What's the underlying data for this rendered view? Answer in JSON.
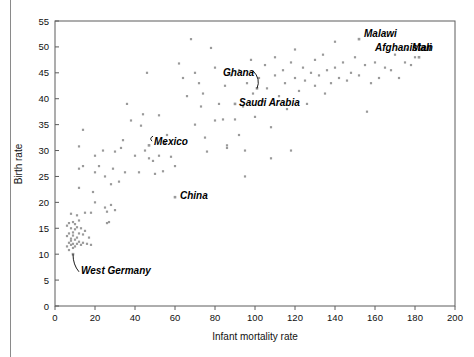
{
  "figure": {
    "background": "#ffffff",
    "frame_color": "#5c5c5c",
    "point_color": "#9a9a9a",
    "label_color": "#000000"
  },
  "chart_data": {
    "type": "scatter",
    "title": "",
    "xlabel": "Infant mortality rate",
    "ylabel": "Birth rate",
    "xlim": [
      0,
      200
    ],
    "ylim": [
      0,
      55
    ],
    "xticks": [
      0,
      20,
      40,
      60,
      80,
      100,
      120,
      140,
      160,
      180,
      200
    ],
    "yticks": [
      0,
      5,
      10,
      15,
      20,
      25,
      30,
      35,
      40,
      45,
      50,
      55
    ],
    "grid": false,
    "legend": null,
    "marker": "square-dot",
    "annotations": [
      {
        "label": "Malawi",
        "x": 152,
        "y": 51.5,
        "text_dx": 5,
        "text_dy": 1.0,
        "anchor": "start",
        "leader": "none"
      },
      {
        "label": "Mali",
        "x": 176,
        "y": 49.5,
        "text_dx": 5,
        "text_dy": 0.3,
        "anchor": "start",
        "leader": "none"
      },
      {
        "label": "Afghanistan",
        "x": 182,
        "y": 48.0,
        "text_dx": -44,
        "text_dy": 1.8,
        "anchor": "start",
        "leader": "none"
      },
      {
        "label": "Ghana",
        "x": 101,
        "y": 42.0,
        "text_dx": -34,
        "text_dy": 3.0,
        "anchor": "start",
        "leader": "curve-down-right"
      },
      {
        "label": "Saudi Arabia",
        "x": 90,
        "y": 39.0,
        "text_dx": 4,
        "text_dy": 0.2,
        "anchor": "start",
        "leader": "none"
      },
      {
        "label": "Mexico",
        "x": 47,
        "y": 31.0,
        "text_dx": 5,
        "text_dy": 0.8,
        "anchor": "start",
        "leader": "hook-left"
      },
      {
        "label": "China",
        "x": 60,
        "y": 21.0,
        "text_dx": 5,
        "text_dy": 0.3,
        "anchor": "start",
        "leader": "none"
      },
      {
        "label": "West Germany",
        "x": 9,
        "y": 10.0,
        "text_dx": 8,
        "text_dy": -3.2,
        "anchor": "start",
        "leader": "curve-up-left"
      }
    ],
    "points": [
      [
        6,
        13.5
      ],
      [
        6,
        15.5
      ],
      [
        6,
        11.5
      ],
      [
        7,
        16.0
      ],
      [
        7,
        14.0
      ],
      [
        7,
        12.2
      ],
      [
        7,
        10.8
      ],
      [
        8,
        17.8
      ],
      [
        8,
        15.0
      ],
      [
        8,
        13.0
      ],
      [
        8,
        11.8
      ],
      [
        8,
        12.6
      ],
      [
        9,
        16.2
      ],
      [
        9,
        14.2
      ],
      [
        9,
        12.0
      ],
      [
        9,
        11.2
      ],
      [
        9,
        13.6
      ],
      [
        10,
        15.8
      ],
      [
        10,
        14.8
      ],
      [
        10,
        12.8
      ],
      [
        10,
        11.5
      ],
      [
        11,
        17.5
      ],
      [
        11,
        15.2
      ],
      [
        11,
        13.2
      ],
      [
        11,
        12.0
      ],
      [
        12,
        22.8
      ],
      [
        12,
        16.5
      ],
      [
        12,
        14.0
      ],
      [
        12,
        12.4
      ],
      [
        13,
        15.0
      ],
      [
        13,
        11.8
      ],
      [
        14,
        13.8
      ],
      [
        14,
        12.2
      ],
      [
        15,
        18.0
      ],
      [
        15,
        14.5
      ],
      [
        16,
        12.0
      ],
      [
        17,
        13.2
      ],
      [
        18,
        18.0
      ],
      [
        18,
        11.8
      ],
      [
        12,
        26.5
      ],
      [
        14,
        27.0
      ],
      [
        12,
        30.8
      ],
      [
        14,
        34.0
      ],
      [
        19,
        22.0
      ],
      [
        20,
        20.0
      ],
      [
        20,
        25.8
      ],
      [
        20,
        29.0
      ],
      [
        22,
        27.0
      ],
      [
        24,
        30.0
      ],
      [
        25,
        25.0
      ],
      [
        25,
        19.0
      ],
      [
        26,
        16.0
      ],
      [
        26,
        18.2
      ],
      [
        27,
        16.2
      ],
      [
        28,
        19.5
      ],
      [
        28,
        23.5
      ],
      [
        29,
        26.5
      ],
      [
        30,
        29.8
      ],
      [
        30,
        18.5
      ],
      [
        32,
        24.0
      ],
      [
        33,
        30.5
      ],
      [
        34,
        32.0
      ],
      [
        35,
        25.8
      ],
      [
        36,
        39.0
      ],
      [
        38,
        35.8
      ],
      [
        40,
        29.0
      ],
      [
        42,
        25.8
      ],
      [
        43,
        34.8
      ],
      [
        44,
        37.0
      ],
      [
        45,
        30.0
      ],
      [
        46,
        45.0
      ],
      [
        47,
        28.5
      ],
      [
        49,
        28.0
      ],
      [
        50,
        25.5
      ],
      [
        52,
        36.8
      ],
      [
        52,
        29.0
      ],
      [
        54,
        26.0
      ],
      [
        55,
        31.5
      ],
      [
        56,
        33.0
      ],
      [
        58,
        28.8
      ],
      [
        60,
        27.0
      ],
      [
        62,
        46.8
      ],
      [
        64,
        44.0
      ],
      [
        66,
        40.5
      ],
      [
        68,
        51.5
      ],
      [
        70,
        45.0
      ],
      [
        70,
        35.0
      ],
      [
        72,
        43.0
      ],
      [
        73,
        38.5
      ],
      [
        74,
        41.0
      ],
      [
        75,
        32.5
      ],
      [
        76,
        29.8
      ],
      [
        78,
        49.8
      ],
      [
        80,
        46.0
      ],
      [
        80,
        35.8
      ],
      [
        82,
        39.0
      ],
      [
        84,
        36.0
      ],
      [
        85,
        42.5
      ],
      [
        86,
        30.5
      ],
      [
        88,
        44.5
      ],
      [
        90,
        36.0
      ],
      [
        92,
        33.0
      ],
      [
        92,
        45.5
      ],
      [
        94,
        38.5
      ],
      [
        95,
        30.0
      ],
      [
        96,
        43.0
      ],
      [
        98,
        47.5
      ],
      [
        99,
        41.0
      ],
      [
        100,
        36.5
      ],
      [
        102,
        44.0
      ],
      [
        104,
        39.5
      ],
      [
        105,
        46.5
      ],
      [
        106,
        42.0
      ],
      [
        108,
        34.5
      ],
      [
        110,
        48.0
      ],
      [
        110,
        44.5
      ],
      [
        112,
        40.5
      ],
      [
        114,
        45.5
      ],
      [
        115,
        43.0
      ],
      [
        116,
        38.0
      ],
      [
        118,
        47.0
      ],
      [
        120,
        49.5
      ],
      [
        120,
        44.0
      ],
      [
        122,
        41.5
      ],
      [
        124,
        46.0
      ],
      [
        125,
        43.5
      ],
      [
        126,
        39.0
      ],
      [
        128,
        45.0
      ],
      [
        130,
        47.5
      ],
      [
        130,
        42.5
      ],
      [
        132,
        44.5
      ],
      [
        134,
        48.5
      ],
      [
        135,
        41.0
      ],
      [
        136,
        45.5
      ],
      [
        138,
        43.0
      ],
      [
        140,
        51.0
      ],
      [
        140,
        46.0
      ],
      [
        142,
        44.0
      ],
      [
        144,
        47.0
      ],
      [
        146,
        43.5
      ],
      [
        148,
        45.0
      ],
      [
        150,
        48.0
      ],
      [
        152,
        44.5
      ],
      [
        155,
        46.5
      ],
      [
        156,
        37.5
      ],
      [
        158,
        43.0
      ],
      [
        160,
        47.0
      ],
      [
        162,
        44.0
      ],
      [
        165,
        46.0
      ],
      [
        168,
        45.5
      ],
      [
        170,
        48.5
      ],
      [
        172,
        44.0
      ],
      [
        175,
        47.0
      ],
      [
        178,
        46.5
      ],
      [
        180,
        48.0
      ],
      [
        95,
        25.0
      ],
      [
        108,
        28.5
      ],
      [
        86,
        31.0
      ],
      [
        118,
        30.0
      ]
    ]
  }
}
